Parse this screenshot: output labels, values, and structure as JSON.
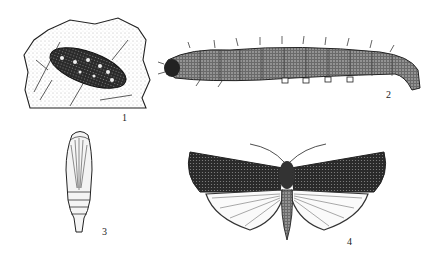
{
  "figure": {
    "panels": [
      {
        "id": "1",
        "label": "1",
        "subject": "larva-on-leaf"
      },
      {
        "id": "2",
        "label": "2",
        "subject": "caterpillar"
      },
      {
        "id": "3",
        "label": "3",
        "subject": "pupa"
      },
      {
        "id": "4",
        "label": "4",
        "subject": "adult-moth"
      }
    ]
  }
}
